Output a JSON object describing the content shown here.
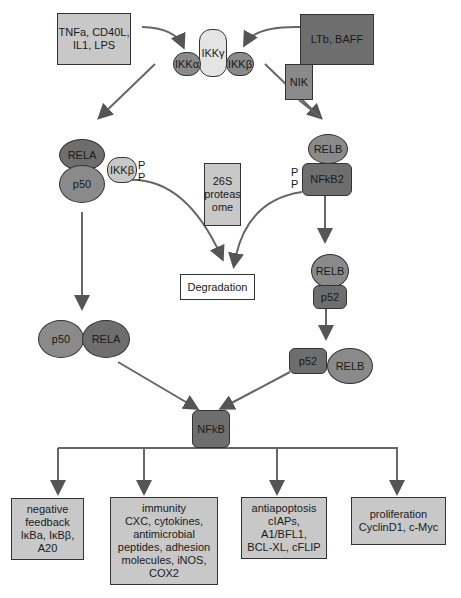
{
  "diagram": {
    "type": "NF-kB signaling pathway",
    "stimuli": {
      "canonical": "TNFa, CD40L, IL1, LPS",
      "noncanonical": "LTb, BAFF"
    },
    "ikk_complex": {
      "alpha": "IKKα",
      "gamma": "IKKγ",
      "beta": "IKKβ"
    },
    "nik": "NIK",
    "canonical_complex": {
      "rela": "RELA",
      "p50": "p50",
      "ikkb": "IKKβ",
      "phospho": [
        "P",
        "P"
      ]
    },
    "proteasome": "26S proteas ome",
    "degradation": "Degradation",
    "noncanonical_complex": {
      "relb": "RELB",
      "nfkb2": "NFkB2",
      "phospho": [
        "P",
        "P"
      ]
    },
    "processed": {
      "relb": "RELB",
      "p52": "p52"
    },
    "canonical_dimer": {
      "p50": "p50",
      "rela": "RELA"
    },
    "noncanonical_dimer": {
      "p52": "p52",
      "relb": "RELB"
    },
    "nfkb": "NFkB",
    "outputs": [
      {
        "title": "negative feedback",
        "lines": [
          "negative",
          "feedback",
          "IκBa, IκBβ,",
          "A20"
        ]
      },
      {
        "title": "immunity",
        "lines": [
          "immunity",
          "CXC, cytokines,",
          "antimicrobial",
          "peptides, adhesion",
          "molecules, iNOS,",
          "COX2"
        ]
      },
      {
        "title": "antiapoptosis",
        "lines": [
          "antiapoptosis",
          "cIAPs, A1/BFL1,",
          "BCL-XL, cFLIP"
        ]
      },
      {
        "title": "proliferation",
        "lines": [
          "proliferation",
          "CyclinD1, c-Myc"
        ]
      }
    ]
  }
}
